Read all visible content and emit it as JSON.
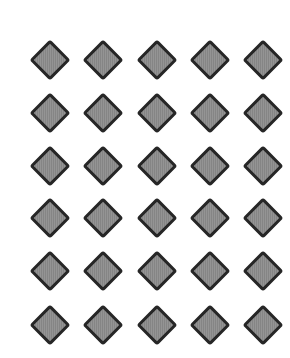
{
  "pattern": {
    "shape": "diamond",
    "rows": 6,
    "columns": 5,
    "fill_color": "#8c8c8c",
    "border_color": "#262626",
    "background_color": "#ffffff",
    "column_centers_x": [
      50,
      103,
      157,
      210,
      263
    ],
    "row_centers_y": [
      60,
      113,
      166,
      218,
      271,
      325
    ]
  }
}
